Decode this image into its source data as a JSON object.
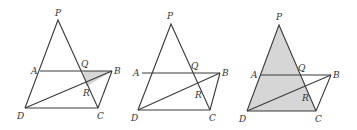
{
  "figures": [
    {
      "id": "fig1",
      "shaded_region": "triangle QRB",
      "points": {
        "P": [
          58,
          20
        ],
        "A": [
          40,
          71
        ],
        "Q": [
          83,
          71
        ],
        "B": [
          112,
          71
        ],
        "R": [
          86,
          87
        ],
        "D": [
          25,
          108
        ],
        "C": [
          98,
          108
        ]
      },
      "labels": {
        "P": "P",
        "A": "A",
        "Q": "Q",
        "B": "B",
        "R": "R",
        "D": "D",
        "C": "C"
      }
    },
    {
      "id": "fig2",
      "shaded_region": "none",
      "points": {
        "P": [
          171,
          24
        ],
        "A": [
          142,
          73
        ],
        "Q": [
          193,
          73
        ],
        "B": [
          220,
          73
        ],
        "R": [
          198,
          89
        ],
        "D": [
          138,
          110
        ],
        "C": [
          210,
          110
        ]
      },
      "labels": {
        "P": "P",
        "A": "A",
        "Q": "Q",
        "B": "B",
        "R": "R",
        "D": "D",
        "C": "C"
      }
    },
    {
      "id": "fig3",
      "shaded_region": "quadrilateral region P-D-C (triangle PDC)",
      "points": {
        "P": [
          279,
          25
        ],
        "A": [
          261,
          75
        ],
        "Q": [
          300,
          75
        ],
        "B": [
          331,
          75
        ],
        "R": [
          305,
          92
        ],
        "D": [
          247,
          111
        ],
        "C": [
          316,
          111
        ]
      },
      "labels": {
        "P": "P",
        "A": "A",
        "Q": "Q",
        "B": "B",
        "R": "R",
        "D": "D",
        "C": "C"
      }
    }
  ]
}
